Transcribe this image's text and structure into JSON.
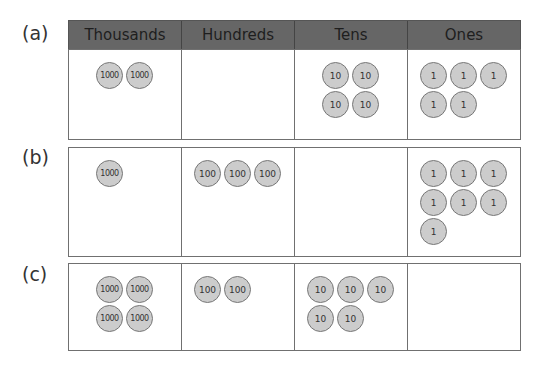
{
  "headers": [
    "Thousands",
    "Hundreds",
    "Tens",
    "Ones"
  ],
  "rows": [
    {
      "label": "(a)",
      "thousands": [
        "1000",
        "1000"
      ],
      "hundreds": [],
      "tens": [
        "10",
        "10",
        "10",
        "10"
      ],
      "ones": [
        "1",
        "1",
        "1",
        "1",
        "1"
      ]
    },
    {
      "label": "(b)",
      "thousands": [
        "1000"
      ],
      "hundreds": [
        "100",
        "100",
        "100"
      ],
      "tens": [],
      "ones": [
        "1",
        "1",
        "1",
        "1",
        "1",
        "1",
        "1"
      ]
    },
    {
      "label": "(c)",
      "thousands": [
        "1000",
        "1000",
        "1000",
        "1000"
      ],
      "hundreds": [
        "100",
        "100"
      ],
      "tens": [
        "10",
        "10",
        "10",
        "10",
        "10"
      ],
      "ones": []
    }
  ],
  "colors": {
    "header_bg": "#666666",
    "counter_fill": "#cccccc",
    "border": "#707070"
  }
}
